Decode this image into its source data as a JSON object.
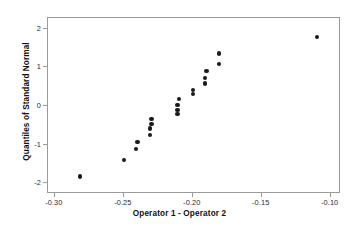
{
  "chart_data": {
    "type": "scatter",
    "title": "",
    "xlabel": "Operator 1 - Operator 2",
    "ylabel": "Quantiles of Standard Normal",
    "xlim": [
      -0.305,
      -0.0925
    ],
    "ylim": [
      -2.28,
      2.28
    ],
    "grid": false,
    "legend": null,
    "xticks": [
      -0.3,
      -0.25,
      -0.2,
      -0.15,
      -0.1
    ],
    "xtick_labels": [
      "-0.30",
      "-0.25",
      "-0.20",
      "-0.15",
      "-0.10"
    ],
    "yticks": [
      2,
      1,
      0,
      -1,
      -2
    ],
    "ytick_labels": [
      "2",
      "1",
      "0",
      "-1",
      "-2"
    ],
    "marker": "filled-circle",
    "marker_color": "#1a1a1a",
    "marker_size": 4.4,
    "n_points": 20,
    "points": [
      {
        "x": -0.282,
        "y": -1.83
      },
      {
        "x": -0.25,
        "y": -1.4
      },
      {
        "x": -0.241,
        "y": -1.12
      },
      {
        "x": -0.24,
        "y": -0.93
      },
      {
        "x": -0.231,
        "y": -0.75
      },
      {
        "x": -0.231,
        "y": -0.58
      },
      {
        "x": -0.23,
        "y": -0.47
      },
      {
        "x": -0.23,
        "y": -0.34
      },
      {
        "x": -0.211,
        "y": -0.21
      },
      {
        "x": -0.211,
        "y": -0.1
      },
      {
        "x": -0.211,
        "y": 0.02
      },
      {
        "x": -0.21,
        "y": 0.18
      },
      {
        "x": -0.2,
        "y": 0.31
      },
      {
        "x": -0.2,
        "y": 0.42
      },
      {
        "x": -0.191,
        "y": 0.58
      },
      {
        "x": -0.191,
        "y": 0.72
      },
      {
        "x": -0.19,
        "y": 0.9
      },
      {
        "x": -0.181,
        "y": 1.09
      },
      {
        "x": -0.181,
        "y": 1.36
      },
      {
        "x": -0.11,
        "y": 1.79
      }
    ]
  },
  "axes": {
    "frame_color": "#9a9a9a",
    "background": "#ffffff"
  }
}
